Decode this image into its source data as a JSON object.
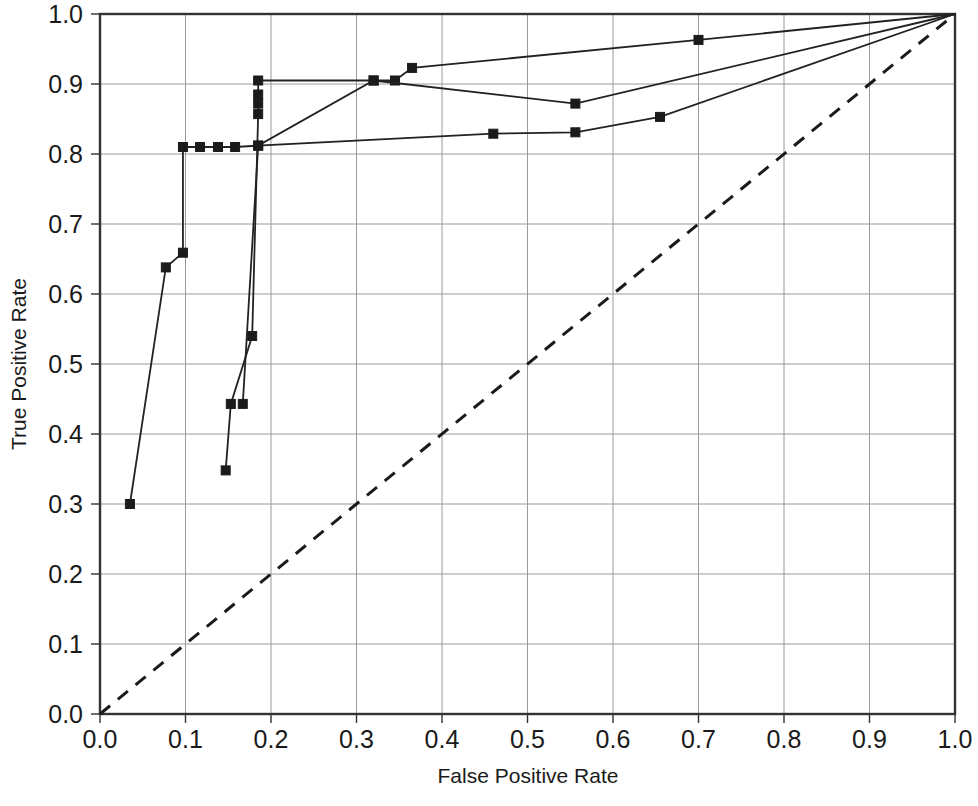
{
  "chart_data": {
    "type": "line",
    "title": "",
    "xlabel": "False Positive Rate",
    "ylabel": "True Positive Rate",
    "xlim": [
      0.0,
      1.0
    ],
    "ylim": [
      0.0,
      1.0
    ],
    "grid": true,
    "legend": "none",
    "xticks": [
      "0.0",
      "0.1",
      "0.2",
      "0.3",
      "0.4",
      "0.5",
      "0.6",
      "0.7",
      "0.8",
      "0.9",
      "1.0"
    ],
    "yticks": [
      "0.0",
      "0.1",
      "0.2",
      "0.3",
      "0.4",
      "0.5",
      "0.6",
      "0.7",
      "0.8",
      "0.9",
      "1.0"
    ],
    "xtick_values": [
      0.0,
      0.1,
      0.2,
      0.3,
      0.4,
      0.5,
      0.6,
      0.7,
      0.8,
      0.9,
      1.0
    ],
    "ytick_values": [
      0.0,
      0.1,
      0.2,
      0.3,
      0.4,
      0.5,
      0.6,
      0.7,
      0.8,
      0.9,
      1.0
    ],
    "series": [
      {
        "name": "roc-curve-1",
        "style": "solid-with-square-markers",
        "color": "#222222",
        "markers": true,
        "points": [
          [
            0.035,
            0.3
          ],
          [
            0.077,
            0.638
          ],
          [
            0.097,
            0.659
          ],
          [
            0.097,
            0.81
          ],
          [
            0.117,
            0.81
          ],
          [
            0.138,
            0.81
          ],
          [
            0.158,
            0.81
          ],
          [
            0.185,
            0.812
          ],
          [
            0.32,
            0.905
          ],
          [
            0.345,
            0.905
          ],
          [
            0.365,
            0.923
          ],
          [
            0.7,
            0.963
          ],
          [
            1.0,
            1.0
          ]
        ]
      },
      {
        "name": "roc-curve-2",
        "style": "solid-with-square-markers",
        "color": "#222222",
        "markers": true,
        "points": [
          [
            0.147,
            0.348
          ],
          [
            0.153,
            0.443
          ],
          [
            0.178,
            0.54
          ],
          [
            0.185,
            0.857
          ],
          [
            0.185,
            0.872
          ],
          [
            0.185,
            0.885
          ],
          [
            0.185,
            0.905
          ],
          [
            0.32,
            0.905
          ],
          [
            0.556,
            0.872
          ],
          [
            1.0,
            1.0
          ]
        ]
      },
      {
        "name": "roc-curve-3",
        "style": "solid-with-square-markers",
        "color": "#222222",
        "markers": true,
        "points": [
          [
            0.167,
            0.443
          ],
          [
            0.185,
            0.812
          ],
          [
            0.46,
            0.829
          ],
          [
            0.556,
            0.831
          ],
          [
            0.655,
            0.853
          ],
          [
            1.0,
            1.0
          ]
        ]
      },
      {
        "name": "chance-diagonal",
        "style": "dashed",
        "color": "#1a1a1a",
        "markers": false,
        "points": [
          [
            0.0,
            0.0
          ],
          [
            1.0,
            1.0
          ]
        ]
      }
    ]
  },
  "axes": {
    "x_title": "False Positive Rate",
    "y_title": "True Positive Rate"
  }
}
